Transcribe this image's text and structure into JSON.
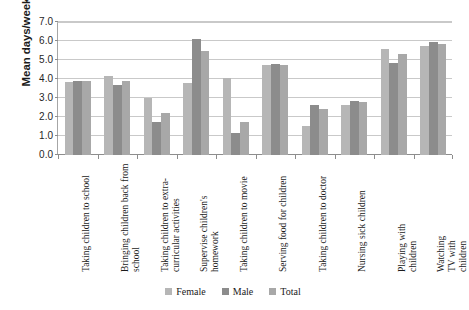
{
  "chart_data": {
    "type": "bar",
    "title": "",
    "xlabel": "",
    "ylabel": "Mean days/week",
    "ylim": [
      0,
      7
    ],
    "ytick_labels": [
      "0.0",
      "1.0",
      "2.0",
      "3.0",
      "4.0",
      "5.0",
      "6.0",
      "7.0"
    ],
    "ytick_values": [
      0,
      1,
      2,
      3,
      4,
      5,
      6,
      7
    ],
    "grid": true,
    "legend_position": "bottom",
    "categories": [
      "Taking children to school",
      "Bringing children back from school",
      "Taking children to extra-curricular activities",
      "Supervise children's homework",
      "Taking children to movie",
      "Serving food for children",
      "Taking children to doctor",
      "Nursing sick children",
      "Playing with children",
      "Watching TV with children"
    ],
    "category_lines": [
      "Taking children to school",
      "Bringing children back from\nschool",
      "Taking children to extra-\ncurricular activities",
      "Supervise children's\nhomework",
      "Taking children to movie",
      "Serving food for children",
      "Taking children to doctor",
      "Nursing sick children",
      "Playing with children",
      "Watching TV with children"
    ],
    "series": [
      {
        "name": "Female",
        "color": "#b6b6b6",
        "values": [
          3.85,
          4.15,
          3.0,
          3.8,
          4.05,
          4.75,
          1.55,
          2.65,
          5.6,
          5.75
        ]
      },
      {
        "name": "Male",
        "color": "#8c8c8c",
        "values": [
          3.9,
          3.7,
          1.75,
          6.1,
          1.15,
          4.8,
          2.65,
          2.85,
          4.85,
          5.95
        ]
      },
      {
        "name": "Total",
        "color": "#a8a8a8",
        "values": [
          3.9,
          3.9,
          2.2,
          5.5,
          1.75,
          4.75,
          2.4,
          2.8,
          5.3,
          5.85
        ]
      }
    ]
  },
  "legend": {
    "items": [
      {
        "label": "Female",
        "color": "#b6b6b6"
      },
      {
        "label": "Male",
        "color": "#8c8c8c"
      },
      {
        "label": "Total",
        "color": "#a8a8a8"
      }
    ]
  }
}
